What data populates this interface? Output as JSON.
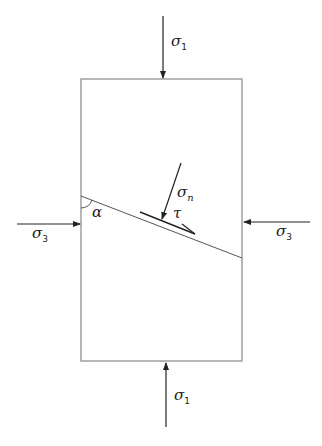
{
  "diagram": {
    "colors": {
      "stroke": "#222222",
      "box": "#888888",
      "background": "#ffffff"
    },
    "specimen": {
      "x": 81,
      "y": 79,
      "width": 161,
      "height": 282
    },
    "plane": {
      "x1": 81,
      "y1": 196,
      "x2": 242,
      "y2": 258
    },
    "labels": {
      "sigma1_top": {
        "symbol": "σ",
        "subscript": "1"
      },
      "sigma1_bottom": {
        "symbol": "σ",
        "subscript": "1"
      },
      "sigma3_left": {
        "symbol": "σ",
        "subscript": "3"
      },
      "sigma3_right": {
        "symbol": "σ",
        "subscript": "3"
      },
      "sigma_n": {
        "symbol": "σ",
        "subscript": "n"
      },
      "tau": {
        "symbol": "τ"
      },
      "alpha": {
        "symbol": "α"
      }
    }
  }
}
